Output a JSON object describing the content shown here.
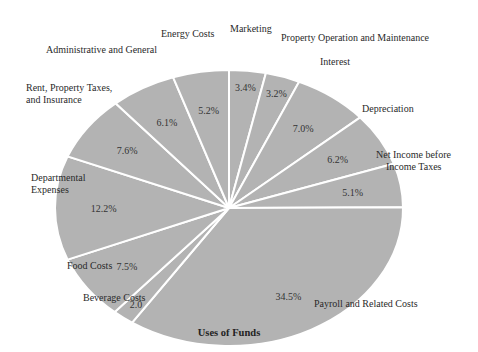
{
  "chart_data": {
    "type": "pie",
    "title": "Uses of Funds",
    "note": "Values are the printed labels (sum 100%); the source image draws Payroll much larger than its 34.5% label.",
    "slices": [
      {
        "label": "Marketing",
        "value": 3.4,
        "value_label": "3.4%"
      },
      {
        "label": "Property Operation and Maintenance",
        "value": 3.2,
        "value_label": "3.2%"
      },
      {
        "label": "Interest",
        "value": 7.0,
        "value_label": "7.0%"
      },
      {
        "label": "Depreciation",
        "value": 6.2,
        "value_label": "6.2%"
      },
      {
        "label": "Net Income before Income Taxes",
        "value": 5.1,
        "value_label": "5.1%"
      },
      {
        "label": "Payroll and Related Costs",
        "value": 34.5,
        "value_label": "34.5%"
      },
      {
        "label": "Beverage Costs",
        "value": 2.0,
        "value_label": "2.0"
      },
      {
        "label": "Food Costs",
        "value": 7.5,
        "value_label": "7.5%"
      },
      {
        "label": "Departmental Expenses",
        "value": 12.2,
        "value_label": "12.2%"
      },
      {
        "label": "Rent, Property Taxes, and Insurance",
        "value": 7.6,
        "value_label": "7.6%"
      },
      {
        "label": "Administrative and General",
        "value": 6.1,
        "value_label": "6.1%"
      },
      {
        "label": "Energy Costs",
        "value": 5.2,
        "value_label": "5.2%"
      }
    ],
    "slice_color": "#b3b3b3",
    "separator_color": "#ffffff"
  },
  "labels": {
    "energy": "Energy Costs",
    "marketing": "Marketing",
    "property_op": "Property Operation and Maintenance",
    "admin": "Administrative and General",
    "interest": "Interest",
    "rent_1": "Rent, Property Taxes,",
    "rent_2": "and Insurance",
    "depreciation": "Depreciation",
    "net_income_1": "Net Income before",
    "net_income_2": "Income Taxes",
    "departmental_1": "Departmental",
    "departmental_2": "Expenses",
    "food": "Food Costs",
    "beverage": "Beverage Costs",
    "payroll": "Payroll and Related Costs"
  }
}
